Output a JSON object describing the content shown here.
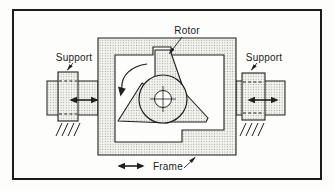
{
  "figure": {
    "type": "mechanical-schematic",
    "labels": {
      "rotor": "Rotor",
      "frame": "Frame",
      "support_left": "Support",
      "support_right": "Support"
    },
    "annotations": {
      "rotation_direction": "counterclockwise",
      "support_left_motion": "horizontal double arrow",
      "support_right_motion": "horizontal double arrow",
      "frame_motion": "horizontal double arrow"
    },
    "colors": {
      "line": "#1f1f1f",
      "border": "#1c1c1c",
      "background": "#fdfdfb",
      "stipple_dot": "#a3a39d",
      "stipple_bg": "#f3f3ef"
    }
  }
}
